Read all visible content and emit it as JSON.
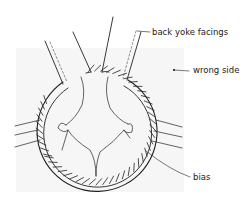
{
  "diagram": {
    "type": "sewing-illustration",
    "labels": [
      {
        "id": "back-yoke-facings",
        "text": "back yoke facings"
      },
      {
        "id": "wrong-side",
        "text": "wrong side"
      },
      {
        "id": "bias",
        "text": "bias"
      }
    ],
    "colors": {
      "ink": "#222222",
      "background": "#ffffff",
      "panel": "#f6f6f6"
    }
  }
}
